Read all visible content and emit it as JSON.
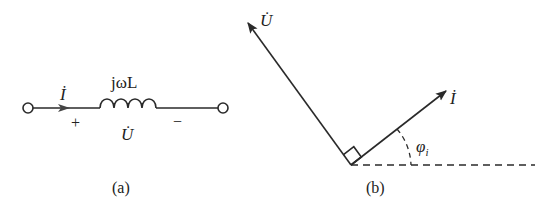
{
  "panel_a": {
    "caption": "(a)",
    "current_label": "İ",
    "impedance_label": "jωL",
    "voltage_label": "U̇",
    "plus_sign": "+",
    "minus_sign": "−",
    "element": "inductor"
  },
  "panel_b": {
    "caption": "(b)",
    "voltage_phasor_label": "U̇",
    "current_phasor_label": "İ",
    "angle_label": "φ",
    "angle_subscript": "i",
    "current_angle_deg": 35,
    "voltage_leads_current_deg": 90
  }
}
